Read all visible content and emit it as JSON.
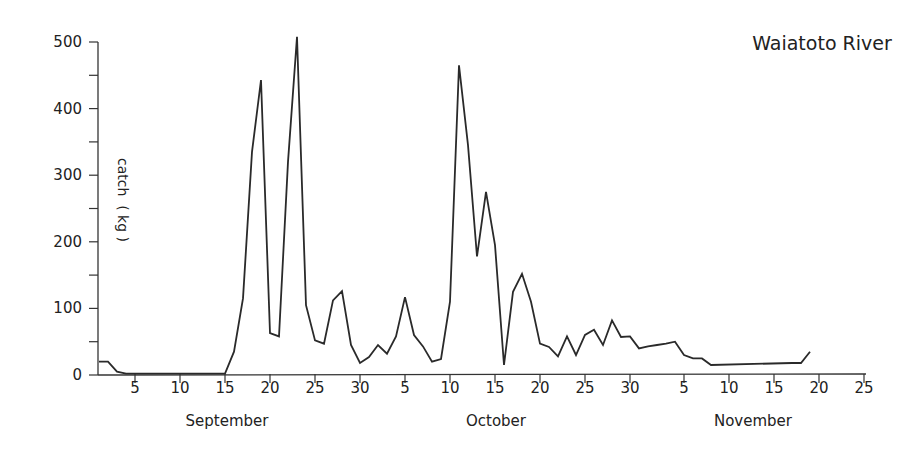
{
  "chart_data": {
    "type": "line",
    "title": "Waiatoto River",
    "xlabel": "",
    "ylabel": "catch  ( kg )",
    "ylim": [
      0,
      500
    ],
    "yticks": [
      0,
      100,
      200,
      300,
      400,
      500
    ],
    "y_minor_ticks": [
      50,
      150,
      250,
      350,
      450
    ],
    "grid": false,
    "legend": null,
    "x_months": [
      {
        "name": "September",
        "ticks": [
          "5",
          "10",
          "15",
          "20",
          "25",
          "30"
        ]
      },
      {
        "name": "October",
        "ticks": [
          "5",
          "10",
          "15",
          "20",
          "25",
          "30"
        ]
      },
      {
        "name": "November",
        "ticks": [
          "5",
          "10",
          "15",
          "20",
          "25"
        ]
      }
    ],
    "x_day_offsets_note": "day 1 = 1 September",
    "series": [
      {
        "name": "catch",
        "points": [
          {
            "day": 1,
            "date": "Sep 1",
            "value": 20
          },
          {
            "day": 2,
            "date": "Sep 2",
            "value": 20
          },
          {
            "day": 3,
            "date": "Sep 3",
            "value": 5
          },
          {
            "day": 4,
            "date": "Sep 4",
            "value": 2
          },
          {
            "day": 15,
            "date": "Sep 15",
            "value": 2
          },
          {
            "day": 16,
            "date": "Sep 16",
            "value": 35
          },
          {
            "day": 17,
            "date": "Sep 17",
            "value": 115
          },
          {
            "day": 18,
            "date": "Sep 18",
            "value": 335
          },
          {
            "day": 19,
            "date": "Sep 19",
            "value": 443
          },
          {
            "day": 20,
            "date": "Sep 20",
            "value": 63
          },
          {
            "day": 21,
            "date": "Sep 21",
            "value": 58
          },
          {
            "day": 22,
            "date": "Sep 22",
            "value": 320
          },
          {
            "day": 23,
            "date": "Sep 23",
            "value": 508
          },
          {
            "day": 24,
            "date": "Sep 24",
            "value": 105
          },
          {
            "day": 25,
            "date": "Sep 25",
            "value": 52
          },
          {
            "day": 26,
            "date": "Sep 26",
            "value": 47
          },
          {
            "day": 27,
            "date": "Sep 27",
            "value": 112
          },
          {
            "day": 28,
            "date": "Sep 28",
            "value": 126
          },
          {
            "day": 29,
            "date": "Sep 29",
            "value": 45
          },
          {
            "day": 30,
            "date": "Sep 30",
            "value": 18
          },
          {
            "day": 31,
            "date": "Oct 1",
            "value": 27
          },
          {
            "day": 32,
            "date": "Oct 2",
            "value": 45
          },
          {
            "day": 33,
            "date": "Oct 3",
            "value": 32
          },
          {
            "day": 34,
            "date": "Oct 4",
            "value": 58
          },
          {
            "day": 35,
            "date": "Oct 5",
            "value": 117
          },
          {
            "day": 36,
            "date": "Oct 6",
            "value": 60
          },
          {
            "day": 37,
            "date": "Oct 7",
            "value": 43
          },
          {
            "day": 38,
            "date": "Oct 8",
            "value": 20
          },
          {
            "day": 39,
            "date": "Oct 9",
            "value": 24
          },
          {
            "day": 40,
            "date": "Oct 10",
            "value": 110
          },
          {
            "day": 41,
            "date": "Oct 11",
            "value": 465
          },
          {
            "day": 42,
            "date": "Oct 12",
            "value": 345
          },
          {
            "day": 43,
            "date": "Oct 13",
            "value": 178
          },
          {
            "day": 44,
            "date": "Oct 14",
            "value": 275
          },
          {
            "day": 45,
            "date": "Oct 15",
            "value": 195
          },
          {
            "day": 46,
            "date": "Oct 16",
            "value": 15
          },
          {
            "day": 47,
            "date": "Oct 17",
            "value": 125
          },
          {
            "day": 48,
            "date": "Oct 18",
            "value": 152
          },
          {
            "day": 49,
            "date": "Oct 19",
            "value": 110
          },
          {
            "day": 50,
            "date": "Oct 20",
            "value": 47
          },
          {
            "day": 51,
            "date": "Oct 21",
            "value": 42
          },
          {
            "day": 52,
            "date": "Oct 22",
            "value": 28
          },
          {
            "day": 53,
            "date": "Oct 23",
            "value": 58
          },
          {
            "day": 54,
            "date": "Oct 24",
            "value": 30
          },
          {
            "day": 55,
            "date": "Oct 25",
            "value": 60
          },
          {
            "day": 56,
            "date": "Oct 26",
            "value": 68
          },
          {
            "day": 57,
            "date": "Oct 27",
            "value": 45
          },
          {
            "day": 58,
            "date": "Oct 28",
            "value": 82
          },
          {
            "day": 59,
            "date": "Oct 29",
            "value": 57
          },
          {
            "day": 60,
            "date": "Oct 30",
            "value": 58
          },
          {
            "day": 61,
            "date": "Oct 31",
            "value": 40
          },
          {
            "day": 62,
            "date": "Nov 1",
            "value": 43
          },
          {
            "day": 63,
            "date": "Nov 2",
            "value": 45
          },
          {
            "day": 64,
            "date": "Nov 3",
            "value": 47
          },
          {
            "day": 65,
            "date": "Nov 4",
            "value": 50
          },
          {
            "day": 66,
            "date": "Nov 5",
            "value": 30
          },
          {
            "day": 67,
            "date": "Nov 6",
            "value": 25
          },
          {
            "day": 68,
            "date": "Nov 7",
            "value": 25
          },
          {
            "day": 69,
            "date": "Nov 8",
            "value": 15
          },
          {
            "day": 78,
            "date": "Nov 17",
            "value": 18
          },
          {
            "day": 79,
            "date": "Nov 18",
            "value": 18
          },
          {
            "day": 80,
            "date": "Nov 19",
            "value": 35
          }
        ]
      }
    ]
  }
}
